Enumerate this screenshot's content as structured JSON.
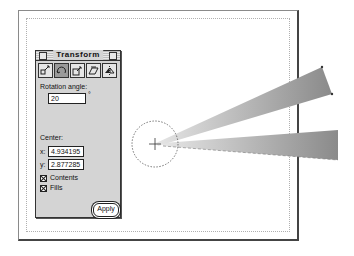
{
  "palette": {
    "title": "Transform",
    "tools": [
      {
        "name": "move-tool-icon",
        "selected": false
      },
      {
        "name": "rotate-tool-icon",
        "selected": true
      },
      {
        "name": "scale-tool-icon",
        "selected": false
      },
      {
        "name": "skew-tool-icon",
        "selected": false
      },
      {
        "name": "reflect-tool-icon",
        "selected": false
      }
    ],
    "rotation_label": "Rotation angle:",
    "rotation_value": "20",
    "degree_symbol": "°",
    "center_label": "Center:",
    "x_label": "x:",
    "x_value": "4.934195",
    "y_label": "y:",
    "y_value": "2.877285",
    "contents_label": "Contents",
    "contents_checked": true,
    "fills_label": "Fills",
    "fills_checked": true,
    "apply_label": "Apply"
  },
  "canvas": {
    "rotation_center": {
      "x": 155,
      "y": 144
    },
    "colors": {
      "beam_light": "#d8d8d8",
      "beam_dark": "#8c8c8c"
    }
  }
}
